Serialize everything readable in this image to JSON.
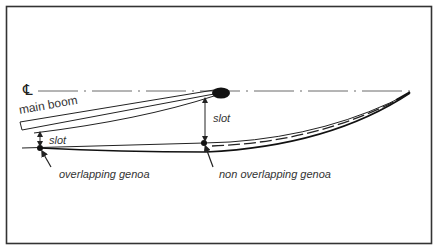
{
  "diagram": {
    "colors": {
      "line": "#222222",
      "frame": "#333333",
      "text": "#333333",
      "background": "#ffffff"
    },
    "labels": {
      "centerline_symbol": "℄",
      "main_boom": "main boom",
      "slot_left": "slot",
      "slot_right": "slot",
      "overlapping_genoa": "overlapping genoa",
      "non_overlapping_genoa": "non overlapping genoa"
    },
    "elements": [
      {
        "id": "centerline",
        "kind": "dash-dot line"
      },
      {
        "id": "mast",
        "kind": "filled ellipse"
      },
      {
        "id": "main-boom",
        "kind": "double line"
      },
      {
        "id": "mainsail",
        "kind": "curve"
      },
      {
        "id": "overlapping-genoa-sheet",
        "kind": "line"
      },
      {
        "id": "non-overlapping-genoa",
        "kind": "dashed curve"
      },
      {
        "id": "slot-arrow-left",
        "kind": "double arrow"
      },
      {
        "id": "slot-arrow-right",
        "kind": "double arrow"
      }
    ]
  }
}
